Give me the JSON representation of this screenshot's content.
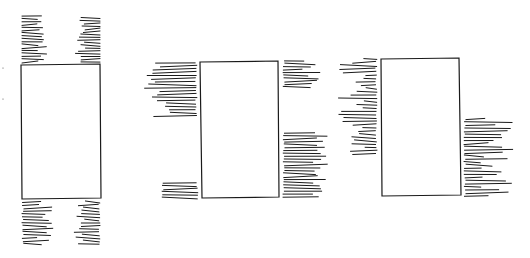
{
  "diagram": {
    "stroke_color": "#1a1a1a",
    "background": "#ffffff",
    "figures": [
      {
        "name": "figure-1",
        "rect": [
          [
            21,
            65
          ],
          [
            100,
            64
          ],
          [
            101,
            198
          ],
          [
            22,
            199
          ]
        ],
        "hatch_groups": [
          {
            "side": "top-left",
            "x_end": 47,
            "x_start_min": 22,
            "x_start_max": 22,
            "y_start": 16,
            "y_end": 62,
            "count": 17,
            "anchor": "left",
            "len_min": 14,
            "len_max": 25
          },
          {
            "side": "top-right",
            "x_end": 100,
            "y_start": 18,
            "y_end": 62,
            "count": 17,
            "anchor": "right",
            "len_min": 14,
            "len_max": 25
          },
          {
            "side": "bottom-left",
            "y_start": 202,
            "y_end": 244,
            "count": 15,
            "anchor": "left",
            "x_anchor": 22,
            "len_min": 14,
            "len_max": 30
          },
          {
            "side": "bottom-right",
            "y_start": 202,
            "y_end": 244,
            "count": 15,
            "anchor": "right",
            "x_anchor": 100,
            "len_min": 14,
            "len_max": 25
          }
        ]
      },
      {
        "name": "figure-2",
        "rect": [
          [
            200,
            62
          ],
          [
            278,
            61
          ],
          [
            279,
            197
          ],
          [
            202,
            198
          ]
        ],
        "hatch_groups": [
          {
            "side": "left-upper",
            "y_start": 63,
            "y_end": 116,
            "count": 18,
            "anchor": "right",
            "x_anchor": 197,
            "len_min": 25,
            "len_max": 52
          },
          {
            "side": "left-lower",
            "y_start": 183,
            "y_end": 198,
            "count": 6,
            "anchor": "right",
            "x_anchor": 198,
            "len_min": 30,
            "len_max": 40
          },
          {
            "side": "right-upper",
            "y_start": 61,
            "y_end": 87,
            "count": 10,
            "anchor": "left",
            "x_anchor": 283,
            "len_min": 18,
            "len_max": 40
          },
          {
            "side": "right-lower",
            "y_start": 133,
            "y_end": 197,
            "count": 23,
            "anchor": "left",
            "x_anchor": 283,
            "len_min": 28,
            "len_max": 44
          }
        ]
      },
      {
        "name": "figure-3",
        "rect": [
          [
            381,
            59
          ],
          [
            459,
            58
          ],
          [
            461,
            195
          ],
          [
            382,
            196
          ]
        ],
        "hatch_groups": [
          {
            "side": "left",
            "y_start": 59,
            "y_end": 154,
            "count": 30,
            "anchor": "right",
            "x_anchor": 377,
            "len_min": 10,
            "len_max": 40
          },
          {
            "side": "right-lower",
            "y_start": 119,
            "y_end": 196,
            "count": 26,
            "anchor": "left",
            "x_anchor": 464,
            "len_min": 16,
            "len_max": 50
          }
        ]
      }
    ],
    "marks": [
      {
        "x": 3,
        "y": 68
      },
      {
        "x": 3,
        "y": 99
      }
    ]
  }
}
